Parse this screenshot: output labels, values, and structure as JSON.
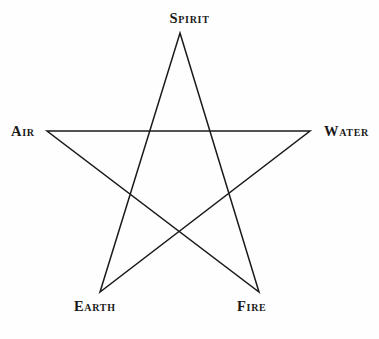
{
  "diagram": {
    "type": "pentagram",
    "background_color": "#fefefe",
    "stroke_color": "#1a1a1a",
    "stroke_width": 1.5,
    "fill": "none",
    "path_points": "180,33 259,292 47,131 310,131 100,292",
    "vertices": [
      {
        "id": "spirit",
        "label": "Spirit",
        "x": 180,
        "y": 33,
        "position": "top"
      },
      {
        "id": "water",
        "label": "Water",
        "x": 310,
        "y": 131,
        "position": "right"
      },
      {
        "id": "fire",
        "label": "Fire",
        "x": 259,
        "y": 292,
        "position": "bottom-right"
      },
      {
        "id": "earth",
        "label": "Earth",
        "x": 100,
        "y": 292,
        "position": "bottom-left"
      },
      {
        "id": "air",
        "label": "Air",
        "x": 47,
        "y": 131,
        "position": "left"
      }
    ]
  }
}
